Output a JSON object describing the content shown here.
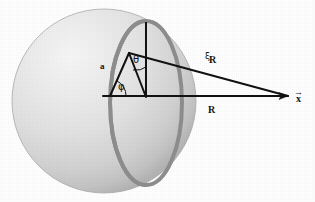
{
  "figure": {
    "background_color": "#ffffff",
    "width": 315,
    "height": 202
  },
  "sphere": {
    "name": "shaded-sphere",
    "center_x": 104,
    "center_y": 101,
    "radius": 92,
    "fill_light": "#f2f2f2",
    "fill_mid": "#dcdcdc",
    "fill_dark": "#b8b8b8",
    "edge_color": "#a8a8a8"
  },
  "ring": {
    "name": "great-circle-ring",
    "center_x": 146,
    "center_y": 103,
    "radius_x": 36,
    "radius_y": 82,
    "stroke_color": "#8e8e8e",
    "stroke_width": 4
  },
  "lines": {
    "color": "#121212",
    "width": 2,
    "radius_a": {
      "from_x": 110,
      "from_y": 96,
      "to_x": 129,
      "to_y": 53
    },
    "chord_to_apex": {
      "from_x": 129,
      "from_y": 53,
      "to_x": 146,
      "to_y": 97
    },
    "axis_R": {
      "from_x": 103,
      "from_y": 96,
      "to_x": 288,
      "to_y": 96
    },
    "hypotenuse_xiR": {
      "from_x": 129,
      "from_y": 53,
      "to_x": 288,
      "to_y": 96
    },
    "vertical_axis": {
      "from_x": 146,
      "from_y": 22,
      "to_x": 146,
      "to_y": 97
    }
  },
  "arcs": {
    "theta_arc": {
      "name": "theta-angle-arc",
      "center_x": 129,
      "center_y": 53,
      "radius": 18
    },
    "phi_arc": {
      "name": "phi-angle-arc",
      "center_x": 110,
      "center_y": 96,
      "radius": 16
    }
  },
  "labels": {
    "radius_a": "a",
    "theta": "θ",
    "phi": "φ",
    "xi": "ξ",
    "xi_subscript": "R",
    "axis_R": "R",
    "position_vector": "x",
    "position_vector_arrow": "→"
  }
}
